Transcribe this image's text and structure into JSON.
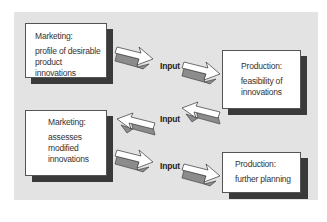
{
  "diagram": {
    "boxes": [
      {
        "id": "marketing-1",
        "title": "Marketing:",
        "body": "profile of desirable product innovations"
      },
      {
        "id": "production-1",
        "title": "Production:",
        "body": "feasibility of innovations"
      },
      {
        "id": "marketing-2",
        "title": "Marketing:",
        "body": "assesses modified innovations"
      },
      {
        "id": "production-2",
        "title": "Production:",
        "body": "further planning"
      }
    ],
    "connector_labels": [
      "Input",
      "Input",
      "Input"
    ],
    "colors": {
      "panel": "#e3e3e3",
      "box": "#ffffff",
      "shadow": "#3a3a3a",
      "arrow_fill": "#ffffff",
      "arrow_side": "#8c8c8c"
    }
  }
}
